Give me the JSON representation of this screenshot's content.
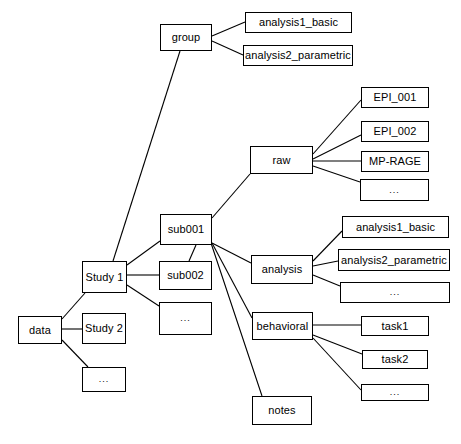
{
  "diagram": {
    "type": "tree",
    "title": "",
    "style": {
      "box_fill": "#ffffff",
      "box_border": "#000000",
      "edge_color": "#000000",
      "text_color": "#000000",
      "background": "#ffffff"
    },
    "nodes": [
      {
        "id": "group",
        "label": "group",
        "x": 160,
        "y": 24,
        "w": 52,
        "h": 27
      },
      {
        "id": "group_analysis1",
        "label": "analysis1_basic",
        "x": 245,
        "y": 12,
        "w": 107,
        "h": 21
      },
      {
        "id": "group_analysis2",
        "label": "analysis2_parametric",
        "x": 243,
        "y": 45,
        "w": 110,
        "h": 21
      },
      {
        "id": "raw",
        "label": "raw",
        "x": 250,
        "y": 146,
        "w": 63,
        "h": 28
      },
      {
        "id": "epi001",
        "label": "EPI_001",
        "x": 361,
        "y": 87,
        "w": 68,
        "h": 21
      },
      {
        "id": "epi002",
        "label": "EPI_002",
        "x": 361,
        "y": 121,
        "w": 68,
        "h": 21
      },
      {
        "id": "mprage",
        "label": "MP-RAGE",
        "x": 361,
        "y": 151,
        "w": 68,
        "h": 21
      },
      {
        "id": "raw_more",
        "label": "...",
        "x": 360,
        "y": 179,
        "w": 69,
        "h": 22
      },
      {
        "id": "sub001",
        "label": "sub001",
        "x": 160,
        "y": 214,
        "w": 52,
        "h": 31
      },
      {
        "id": "sub002",
        "label": "sub002",
        "x": 159,
        "y": 261,
        "w": 53,
        "h": 29
      },
      {
        "id": "sub_more",
        "label": "...",
        "x": 159,
        "y": 302,
        "w": 53,
        "h": 33
      },
      {
        "id": "study1",
        "label": "Study 1",
        "x": 82,
        "y": 261,
        "w": 45,
        "h": 32
      },
      {
        "id": "study2",
        "label": "Study 2",
        "x": 82,
        "y": 313,
        "w": 44,
        "h": 31
      },
      {
        "id": "study_more",
        "label": "...",
        "x": 82,
        "y": 367,
        "w": 44,
        "h": 25
      },
      {
        "id": "data",
        "label": "data",
        "x": 18,
        "y": 316,
        "w": 44,
        "h": 28
      },
      {
        "id": "analysis",
        "label": "analysis",
        "x": 251,
        "y": 255,
        "w": 62,
        "h": 29
      },
      {
        "id": "sub_analysis1",
        "label": "analysis1_basic",
        "x": 342,
        "y": 216,
        "w": 107,
        "h": 22
      },
      {
        "id": "sub_analysis2",
        "label": "analysis2_parametric",
        "x": 338,
        "y": 249,
        "w": 112,
        "h": 22
      },
      {
        "id": "analysis_more",
        "label": "...",
        "x": 340,
        "y": 282,
        "w": 110,
        "h": 21
      },
      {
        "id": "behavioral",
        "label": "behavioral",
        "x": 252,
        "y": 312,
        "w": 61,
        "h": 28
      },
      {
        "id": "task1",
        "label": "task1",
        "x": 361,
        "y": 316,
        "w": 68,
        "h": 20
      },
      {
        "id": "task2",
        "label": "task2",
        "x": 362,
        "y": 350,
        "w": 66,
        "h": 19
      },
      {
        "id": "behavioral_more",
        "label": "...",
        "x": 361,
        "y": 384,
        "w": 68,
        "h": 17
      },
      {
        "id": "notes",
        "label": "notes",
        "x": 252,
        "y": 396,
        "w": 60,
        "h": 29
      }
    ],
    "edges": [
      {
        "from": "group",
        "to": "group_analysis1",
        "x1": 212,
        "y1": 36,
        "x2": 245,
        "y2": 22
      },
      {
        "from": "group",
        "to": "group_analysis2",
        "x1": 212,
        "y1": 41,
        "x2": 243,
        "y2": 55
      },
      {
        "from": "group",
        "to": "study1",
        "x1": 180,
        "y1": 51,
        "x2": 113,
        "y2": 261
      },
      {
        "from": "raw",
        "to": "epi001",
        "x1": 313,
        "y1": 154,
        "x2": 361,
        "y2": 100
      },
      {
        "from": "raw",
        "to": "epi002",
        "x1": 313,
        "y1": 159,
        "x2": 361,
        "y2": 135
      },
      {
        "from": "raw",
        "to": "mprage",
        "x1": 313,
        "y1": 161,
        "x2": 361,
        "y2": 161
      },
      {
        "from": "raw",
        "to": "raw_more",
        "x1": 313,
        "y1": 166,
        "x2": 360,
        "y2": 182
      },
      {
        "from": "sub001",
        "to": "raw",
        "x1": 212,
        "y1": 218,
        "x2": 250,
        "y2": 174
      },
      {
        "from": "sub001",
        "to": "analysis",
        "x1": 212,
        "y1": 243,
        "x2": 251,
        "y2": 263
      },
      {
        "from": "sub001",
        "to": "behavioral",
        "x1": 212,
        "y1": 243,
        "x2": 252,
        "y2": 318
      },
      {
        "from": "sub001",
        "to": "notes",
        "x1": 211,
        "y1": 243,
        "x2": 262,
        "y2": 396
      },
      {
        "from": "sub001",
        "to": "sub002",
        "x1": 196,
        "y1": 245,
        "x2": 189,
        "y2": 261
      },
      {
        "from": "sub001",
        "to": "study1",
        "x1": 160,
        "y1": 241,
        "x2": 127,
        "y2": 265
      },
      {
        "from": "study1",
        "to": "sub002",
        "x1": 127,
        "y1": 275,
        "x2": 159,
        "y2": 275
      },
      {
        "from": "study1",
        "to": "sub_more",
        "x1": 127,
        "y1": 285,
        "x2": 159,
        "y2": 306
      },
      {
        "from": "data",
        "to": "study1",
        "x1": 62,
        "y1": 319,
        "x2": 85,
        "y2": 293
      },
      {
        "from": "data",
        "to": "study2",
        "x1": 62,
        "y1": 329,
        "x2": 82,
        "y2": 329
      },
      {
        "from": "data",
        "to": "study_more",
        "x1": 62,
        "y1": 340,
        "x2": 88,
        "y2": 367
      },
      {
        "from": "analysis",
        "to": "sub_analysis1",
        "x1": 313,
        "y1": 261,
        "x2": 342,
        "y2": 231
      },
      {
        "from": "analysis",
        "to": "sub_analysis2",
        "x1": 313,
        "y1": 266,
        "x2": 338,
        "y2": 261
      },
      {
        "from": "analysis",
        "to": "analysis_more",
        "x1": 313,
        "y1": 275,
        "x2": 340,
        "y2": 286
      },
      {
        "from": "behavioral",
        "to": "task1",
        "x1": 313,
        "y1": 325,
        "x2": 361,
        "y2": 325
      },
      {
        "from": "behavioral",
        "to": "task2",
        "x1": 313,
        "y1": 335,
        "x2": 362,
        "y2": 354
      },
      {
        "from": "behavioral",
        "to": "behavioral_more",
        "x1": 313,
        "y1": 338,
        "x2": 361,
        "y2": 390
      }
    ]
  }
}
